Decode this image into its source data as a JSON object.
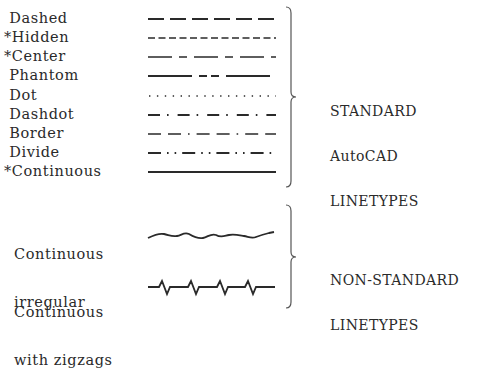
{
  "standard": {
    "items": [
      {
        "label": " Dashed",
        "pattern": "dashed"
      },
      {
        "label": "*Hidden",
        "pattern": "hidden"
      },
      {
        "label": "*Center",
        "pattern": "center"
      },
      {
        "label": " Phantom",
        "pattern": "phantom"
      },
      {
        "label": " Dot",
        "pattern": "dot"
      },
      {
        "label": " Dashdot",
        "pattern": "dashdot"
      },
      {
        "label": " Border",
        "pattern": "border"
      },
      {
        "label": " Divide",
        "pattern": "divide"
      },
      {
        "label": "*Continuous",
        "pattern": "continuous"
      }
    ],
    "group_label": [
      "STANDARD",
      "AutoCAD",
      "LINETYPES"
    ]
  },
  "non_standard": {
    "items": [
      {
        "label_lines": [
          "Continuous",
          "irregular"
        ],
        "pattern": "irregular"
      },
      {
        "label_lines": [
          "Continuous",
          "with zigzags"
        ],
        "pattern": "zigzag"
      }
    ],
    "group_label": [
      "NON-STANDARD",
      "LINETYPES"
    ]
  },
  "colors": {
    "ink": "#2a2a2a",
    "background": "#ffffff"
  }
}
